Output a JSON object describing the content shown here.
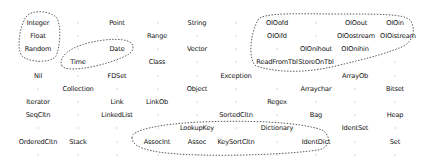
{
  "diagram": {
    "title": "",
    "nodes": [
      {
        "label": "Integer",
        "x": 38,
        "y": 23
      },
      {
        "label": "Point",
        "x": 117,
        "y": 23
      },
      {
        "label": "String",
        "x": 197,
        "y": 23
      },
      {
        "label": "OIOofd",
        "x": 277,
        "y": 23
      },
      {
        "label": "OIOout",
        "x": 356,
        "y": 23
      },
      {
        "label": "OIOin",
        "x": 395,
        "y": 23
      },
      {
        "label": "Float",
        "x": 38,
        "y": 36
      },
      {
        "label": "Range",
        "x": 157,
        "y": 36
      },
      {
        "label": "OIOifd",
        "x": 277,
        "y": 36
      },
      {
        "label": "OIOostream",
        "x": 356,
        "y": 36
      },
      {
        "label": "OIOistream",
        "x": 398,
        "y": 36
      },
      {
        "label": "Random",
        "x": 38,
        "y": 49
      },
      {
        "label": "Date",
        "x": 117,
        "y": 49
      },
      {
        "label": "Vector",
        "x": 197,
        "y": 49
      },
      {
        "label": "OIOnihout",
        "x": 316,
        "y": 49
      },
      {
        "label": "OIOnihin",
        "x": 355,
        "y": 49
      },
      {
        "label": "Time",
        "x": 78,
        "y": 62
      },
      {
        "label": "Class",
        "x": 157,
        "y": 62
      },
      {
        "label": "ReadFromTbl",
        "x": 277,
        "y": 62
      },
      {
        "label": "StoreOnTbl",
        "x": 316,
        "y": 62
      },
      {
        "label": "Nil",
        "x": 38,
        "y": 76
      },
      {
        "label": "FDSet",
        "x": 117,
        "y": 76
      },
      {
        "label": "Exception",
        "x": 236,
        "y": 76
      },
      {
        "label": "ArrayOb",
        "x": 355,
        "y": 76
      },
      {
        "label": "Collection",
        "x": 78,
        "y": 89
      },
      {
        "label": "Object",
        "x": 197,
        "y": 89
      },
      {
        "label": "Arraychar",
        "x": 316,
        "y": 89
      },
      {
        "label": "Bitset",
        "x": 395,
        "y": 89
      },
      {
        "label": "Iterator",
        "x": 38,
        "y": 102
      },
      {
        "label": "Link",
        "x": 117,
        "y": 102
      },
      {
        "label": "LinkOb",
        "x": 157,
        "y": 102
      },
      {
        "label": "Regex",
        "x": 277,
        "y": 102
      },
      {
        "label": "SeqCltn",
        "x": 38,
        "y": 115
      },
      {
        "label": "LinkedList",
        "x": 117,
        "y": 115
      },
      {
        "label": "SortedCltn",
        "x": 236,
        "y": 115
      },
      {
        "label": "Bag",
        "x": 316,
        "y": 115
      },
      {
        "label": "Heap",
        "x": 395,
        "y": 115
      },
      {
        "label": "LookupKey",
        "x": 197,
        "y": 128
      },
      {
        "label": "Dictionary",
        "x": 277,
        "y": 128
      },
      {
        "label": "IdentSet",
        "x": 355,
        "y": 128
      },
      {
        "label": "OrderedCltn",
        "x": 38,
        "y": 142
      },
      {
        "label": "Stack",
        "x": 78,
        "y": 142
      },
      {
        "label": "AssocInt",
        "x": 157,
        "y": 142
      },
      {
        "label": "Assoc",
        "x": 197,
        "y": 142
      },
      {
        "label": "KeySortCltn",
        "x": 236,
        "y": 142
      },
      {
        "label": "IdentDict",
        "x": 316,
        "y": 142
      },
      {
        "label": "Set",
        "x": 395,
        "y": 142
      }
    ],
    "dots": [
      [
        78,
        23
      ],
      [
        158,
        23
      ],
      [
        236,
        23
      ],
      [
        316,
        23
      ],
      [
        78,
        36
      ],
      [
        117,
        36
      ],
      [
        197,
        36
      ],
      [
        236,
        36
      ],
      [
        316,
        36
      ],
      [
        78,
        49
      ],
      [
        158,
        49
      ],
      [
        236,
        49
      ],
      [
        277,
        49
      ],
      [
        38,
        62
      ],
      [
        117,
        62
      ],
      [
        197,
        62
      ],
      [
        236,
        62
      ],
      [
        395,
        62
      ],
      [
        78,
        76
      ],
      [
        158,
        76
      ],
      [
        197,
        76
      ],
      [
        395,
        76
      ],
      [
        38,
        89
      ],
      [
        117,
        89
      ],
      [
        158,
        89
      ],
      [
        236,
        89
      ],
      [
        277,
        89
      ],
      [
        355,
        89
      ],
      [
        78,
        102
      ],
      [
        197,
        102
      ],
      [
        236,
        102
      ],
      [
        316,
        102
      ],
      [
        355,
        102
      ],
      [
        395,
        102
      ],
      [
        78,
        115
      ],
      [
        158,
        115
      ],
      [
        197,
        115
      ],
      [
        277,
        115
      ],
      [
        355,
        115
      ],
      [
        38,
        128
      ],
      [
        78,
        128
      ],
      [
        117,
        128
      ],
      [
        158,
        128
      ],
      [
        236,
        128
      ],
      [
        316,
        128
      ],
      [
        395,
        128
      ],
      [
        117,
        142
      ],
      [
        277,
        142
      ],
      [
        355,
        142
      ],
      [
        38,
        155
      ],
      [
        78,
        155
      ],
      [
        117,
        155
      ],
      [
        158,
        155
      ],
      [
        197,
        155
      ],
      [
        236,
        155
      ],
      [
        277,
        155
      ],
      [
        316,
        155
      ],
      [
        355,
        155
      ],
      [
        395,
        155
      ]
    ],
    "clusters": [
      {
        "name": "numeric-cluster",
        "members": [
          "Integer",
          "Float",
          "Random"
        ]
      },
      {
        "name": "date-time-cluster",
        "members": [
          "Date",
          "Time"
        ]
      },
      {
        "name": "oio-cluster",
        "members": [
          "OIOofd",
          "OIOout",
          "OIOin",
          "OIOifd",
          "OIOostream",
          "OIOistream",
          "OIOnihout",
          "OIOnihin",
          "ReadFromTbl",
          "StoreOnTbl"
        ]
      },
      {
        "name": "dictionary-cluster",
        "members": [
          "LookupKey",
          "Dictionary",
          "AssocInt",
          "Assoc",
          "KeySortCltn",
          "IdentDict"
        ]
      }
    ],
    "colors": {
      "text": "#111111",
      "cluster_outline": "#333333",
      "dot": "#aaaaaa",
      "background": "#ffffff"
    }
  }
}
